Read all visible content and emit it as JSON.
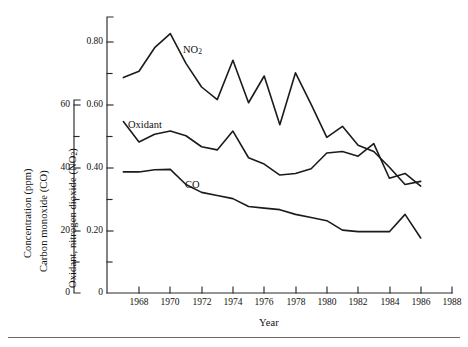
{
  "figure": {
    "background": "#ffffff",
    "line_color": "#1b1b1b",
    "axis_color": "#2a2a2a"
  },
  "labels": {
    "left_axis_title_line1": "Concentration (ppm)",
    "left_axis_title_line2": "Carbon monoxide (CO)",
    "inner_axis_title": "Oxidant, nitrogen dioxide (NO",
    "inner_axis_title_sub": "2",
    "inner_axis_title_end": ")",
    "xaxis_title": "Year",
    "series_no2": "NO",
    "series_no2_sub": "2",
    "series_oxidant": "Oxidant",
    "series_co": "CO"
  },
  "chart_data": {
    "type": "line",
    "title": "",
    "xlabel": "Year",
    "ylabel": "Concentration (ppm) Carbon monoxide (CO)",
    "ylabel_secondary": "Oxidant, nitrogen dioxide (NO2)",
    "grid": false,
    "legend": "inline-annotations",
    "xlim": [
      1966,
      1988
    ],
    "xticks": [
      1968,
      1970,
      1972,
      1974,
      1976,
      1978,
      1980,
      1982,
      1984,
      1986,
      1988
    ],
    "yaxis_left": {
      "name": "Carbon monoxide (CO)",
      "unit": "ppm",
      "ylim": [
        0,
        66
      ],
      "yticks": [
        0,
        20,
        40,
        60
      ],
      "ytick_labels": [
        "0",
        "20",
        "40",
        "60"
      ],
      "minor_ticks": [
        10,
        30,
        50
      ]
    },
    "yaxis_inner": {
      "name": "Oxidant, nitrogen dioxide (NO2)",
      "unit": "ppm",
      "ylim": [
        0,
        0.875
      ],
      "yticks": [
        0,
        0.2,
        0.4,
        0.6,
        0.8
      ],
      "ytick_labels": [
        "0",
        "0.20",
        "0.40",
        "0.60",
        "0.80"
      ],
      "minor_ticks": [
        0.1,
        0.3,
        0.5,
        0.7
      ]
    },
    "x": [
      1967,
      1968,
      1969,
      1970,
      1971,
      1972,
      1973,
      1974,
      1975,
      1976,
      1977,
      1978,
      1979,
      1980,
      1981,
      1982,
      1983,
      1984,
      1985,
      1986
    ],
    "series": [
      {
        "name": "NO2",
        "axis": "inner",
        "values": [
          0.685,
          0.705,
          0.78,
          0.825,
          0.73,
          0.655,
          0.615,
          0.74,
          0.605,
          0.69,
          0.535,
          0.7,
          0.6,
          0.495,
          0.53,
          0.47,
          0.45,
          0.4,
          0.345,
          0.355
        ]
      },
      {
        "name": "Oxidant",
        "axis": "inner",
        "values": [
          0.545,
          0.48,
          0.505,
          0.515,
          0.5,
          0.465,
          0.455,
          0.515,
          0.43,
          0.41,
          0.375,
          0.38,
          0.395,
          0.445,
          0.45,
          0.435,
          0.475,
          0.365,
          0.38,
          0.34
        ]
      },
      {
        "name": "CO",
        "axis": "inner",
        "values": [
          0.385,
          0.385,
          0.392,
          0.393,
          0.345,
          0.32,
          0.31,
          0.3,
          0.275,
          0.27,
          0.265,
          0.25,
          0.24,
          0.23,
          0.2,
          0.195,
          0.195,
          0.195,
          0.25,
          0.175
        ]
      }
    ]
  },
  "ticks": {
    "x_labels": [
      "1968",
      "1970",
      "1972",
      "1974",
      "1976",
      "1978",
      "1980",
      "1982",
      "1984",
      "1986",
      "1988"
    ],
    "y_left_labels": [
      "60",
      "40",
      "20",
      "0"
    ],
    "y_inner_labels": [
      "0.80",
      "0.60",
      "0.40",
      "0.20",
      "0"
    ]
  }
}
